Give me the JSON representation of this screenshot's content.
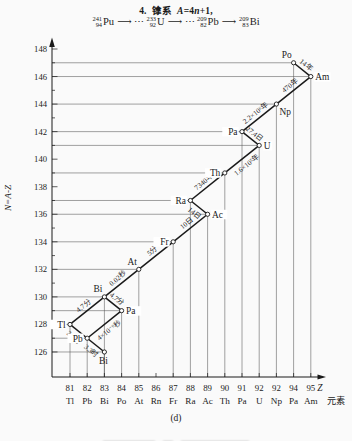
{
  "colors": {
    "ink": "#1a1a1a",
    "paper": "#fafafa"
  },
  "header": {
    "title": {
      "prefix": "4.",
      "series": "镎系",
      "formula": [
        {
          "t": "A",
          "italic": true
        },
        {
          "t": "=4",
          "italic": false
        },
        {
          "t": "n",
          "italic": true
        },
        {
          "t": "+1,",
          "italic": false
        }
      ]
    },
    "decay_chain": [
      {
        "type": "nuclide",
        "mass": "241",
        "z": "94",
        "symbol": "Pu"
      },
      {
        "type": "arrow",
        "glyph": "⟶"
      },
      {
        "type": "dots",
        "glyph": "⋯"
      },
      {
        "type": "nuclide",
        "mass": "233",
        "z": "92",
        "symbol": "U"
      },
      {
        "type": "arrow",
        "glyph": "⟶"
      },
      {
        "type": "dots",
        "glyph": "⋯"
      },
      {
        "type": "nuclide",
        "mass": "209",
        "z": "82",
        "symbol": "Pb"
      },
      {
        "type": "arrow",
        "glyph": "⟶"
      },
      {
        "type": "nuclide",
        "mass": "209",
        "z": "83",
        "symbol": "Bi"
      }
    ]
  },
  "chart_data": {
    "type": "scatter",
    "xlabel": "Z",
    "xlabel_secondary": "元素",
    "ylabel": "N=A-Z",
    "caption": "(d)",
    "grid": "leader-lines-to-axes",
    "y_axis": {
      "min": 126,
      "max": 148,
      "label_step": 2,
      "minor_step": 1
    },
    "x_ticks": [
      {
        "z": "81",
        "el": "Tl"
      },
      {
        "z": "82",
        "el": "Pb"
      },
      {
        "z": "83",
        "el": "Bi"
      },
      {
        "z": "84",
        "el": "Po"
      },
      {
        "z": "85",
        "el": "At"
      },
      {
        "z": "86",
        "el": "Rn"
      },
      {
        "z": "87",
        "el": "Fr"
      },
      {
        "z": "88",
        "el": "Ra"
      },
      {
        "z": "89",
        "el": "Ac"
      },
      {
        "z": "90",
        "el": "Th"
      },
      {
        "z": "91",
        "el": "Pa"
      },
      {
        "z": "92",
        "el": "U"
      },
      {
        "z": "92",
        "el": "Np"
      },
      {
        "z": "94",
        "el": "Pa"
      },
      {
        "z": "95",
        "el": "Am"
      }
    ],
    "nuclides": [
      {
        "el": "Po",
        "Z": 94,
        "N": 147,
        "label": "above-left"
      },
      {
        "el": "Am",
        "Z": 95,
        "N": 146,
        "label": "right"
      },
      {
        "el": "Np",
        "Z": 93,
        "N": 144,
        "label": "below-right"
      },
      {
        "el": "Pa",
        "Z": 91,
        "N": 142,
        "label": "left"
      },
      {
        "el": "U",
        "Z": 92,
        "N": 141,
        "label": "right"
      },
      {
        "el": "Th",
        "Z": 90,
        "N": 139,
        "label": "left"
      },
      {
        "el": "Ra",
        "Z": 88,
        "N": 137,
        "label": "left"
      },
      {
        "el": "Ac",
        "Z": 89,
        "N": 136,
        "label": "right"
      },
      {
        "el": "Fr",
        "Z": 87,
        "N": 134,
        "label": "left"
      },
      {
        "el": "At",
        "Z": 85,
        "N": 132,
        "label": "above-left"
      },
      {
        "el": "Bi",
        "Z": 83,
        "N": 130,
        "label": "above-left"
      },
      {
        "el": "Pa",
        "Z": 84,
        "N": 129,
        "label": "right"
      },
      {
        "el": "Tl",
        "Z": 81,
        "N": 128,
        "label": "left"
      },
      {
        "el": "Pb",
        "Z": 82,
        "N": 127,
        "label": "left"
      },
      {
        "el": "Bi",
        "Z": 83,
        "N": 126,
        "label": "below"
      }
    ],
    "decays": [
      {
        "from": 0,
        "to": 1,
        "halflife": "14年",
        "side": "above"
      },
      {
        "from": 1,
        "to": 2,
        "halflife": "470年",
        "side": "above"
      },
      {
        "from": 2,
        "to": 3,
        "halflife": "2.2×10⁶年",
        "side": "above"
      },
      {
        "from": 3,
        "to": 4,
        "halflife": "27.4日",
        "side": "above"
      },
      {
        "from": 4,
        "to": 5,
        "halflife": "1.6×10⁵年",
        "side": "below"
      },
      {
        "from": 5,
        "to": 6,
        "halflife": "7340年",
        "side": "above"
      },
      {
        "from": 6,
        "to": 7,
        "halflife": "14日",
        "side": "below"
      },
      {
        "from": 7,
        "to": 8,
        "halflife": "10日",
        "side": "above"
      },
      {
        "from": 8,
        "to": 9,
        "halflife": "5分",
        "side": "above"
      },
      {
        "from": 9,
        "to": 10,
        "halflife": "0.02秒",
        "side": "above"
      },
      {
        "from": 10,
        "to": 11,
        "halflife": "4.7分",
        "side": "above"
      },
      {
        "from": 11,
        "to": 13,
        "halflife": "4×10⁻⁶秒",
        "side": "below"
      },
      {
        "from": 10,
        "to": 12,
        "halflife": "4.7分",
        "side": "above"
      },
      {
        "from": 12,
        "to": 13,
        "halflife": "2.2分",
        "side": "below"
      },
      {
        "from": 13,
        "to": 14,
        "halflife": "3.3时",
        "side": "below"
      }
    ]
  }
}
